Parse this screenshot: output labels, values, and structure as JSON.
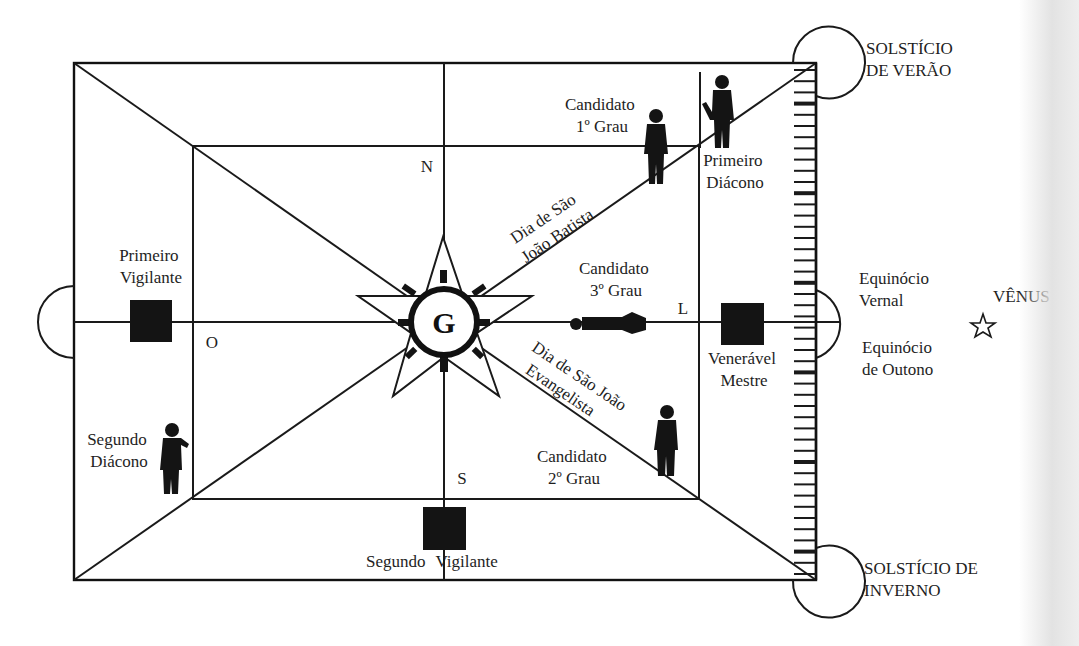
{
  "diagram": {
    "type": "masonic-lodge-floor-plan",
    "center_symbol": "G",
    "cardinal_points": {
      "north": "N",
      "south": "S",
      "east": "L",
      "west": "O"
    },
    "officers": {
      "primeiro_vigilante": [
        "Primeiro",
        "Vigilante"
      ],
      "segundo_vigilante": [
        "Segundo",
        "Vigilante"
      ],
      "veneravel_mestre": [
        "Venerável",
        "Mestre"
      ],
      "primeiro_diacono": [
        "Primeiro",
        "Diácono"
      ],
      "segundo_diacono": [
        "Segundo",
        "Diácono"
      ]
    },
    "candidates": {
      "primeiro_grau": [
        "Candidato",
        "1º Grau"
      ],
      "segundo_grau": [
        "Candidato",
        "2º Grau"
      ],
      "terceiro_grau": [
        "Candidato",
        "3º Grau"
      ]
    },
    "diagonals": {
      "sao_joao_batista": [
        "Dia de São",
        "João Batista"
      ],
      "sao_joao_evangelista": [
        "Dia de São João",
        "Evangelista"
      ]
    },
    "celestial": {
      "solsticio_verao": [
        "SOLSTÍCIO",
        "DE VERÃO"
      ],
      "solsticio_inverno": [
        "SOLSTÍCIO DE",
        "INVERNO"
      ],
      "equinocio_vernal": [
        "Equinócio",
        "Vernal"
      ],
      "equinocio_outono": [
        "Equinócio",
        "de Outono"
      ],
      "venus": "VÊNUS"
    },
    "icons": {
      "venus_star": "outline-star",
      "compass_rose": "five-point-star-with-circle",
      "officer_station": "filled-square",
      "person": "silhouette",
      "ladder": "ruler-ladder"
    }
  }
}
